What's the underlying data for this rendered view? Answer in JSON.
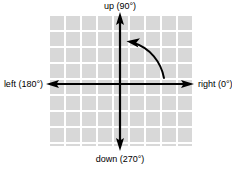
{
  "figure": {
    "background_color": "#ffffff"
  },
  "grid": {
    "fill_color": "#d8d8d8",
    "line_color": "#ffffff",
    "cell_size_px": 16,
    "columns": 9,
    "rows": 8
  },
  "axes": {
    "color": "#000000",
    "origin_label": "",
    "labels": {
      "up": "up (90°)",
      "down": "down (270°)",
      "left": "left (180°)",
      "right": "right (0°)"
    },
    "angles": {
      "up": "90°",
      "down": "270°",
      "left": "180°",
      "right": "0°"
    }
  },
  "rotation_arc": {
    "direction": "counter-clockwise",
    "color": "#000000",
    "description": "curved arrow sweeping counter-clockwise from the right axis toward the up axis"
  }
}
